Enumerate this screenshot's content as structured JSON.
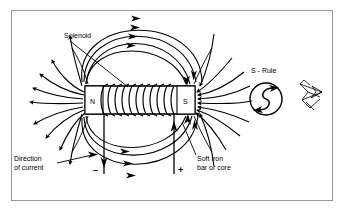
{
  "diagram": {
    "border_color": "#9a9a9a",
    "ink_color": "#000000",
    "background": "#ffffff",
    "labels": {
      "solenoid": "Solenoid",
      "direction_line1": "Direction",
      "direction_line2": "of current",
      "soft_iron_line1": "Soft iron",
      "soft_iron_line2": "bar or core",
      "s_rule": "S - Rule",
      "pole_north": "N",
      "pole_south": "S",
      "terminal_negative": "–",
      "terminal_positive": "+"
    },
    "icons": {
      "s_rule": "s-rule-circle-icon",
      "hand_pointer": "hand-pointer-icon",
      "arrowhead": "arrowhead-icon"
    },
    "core": {
      "x": 85,
      "y": 86,
      "width": 110,
      "height": 28,
      "turns": 11
    },
    "field": {
      "left_fan_lines": 9,
      "right_fan_lines": 9,
      "top_arcs": 4,
      "bottom_arcs": 4,
      "direction": "north-to-south-outside"
    }
  }
}
